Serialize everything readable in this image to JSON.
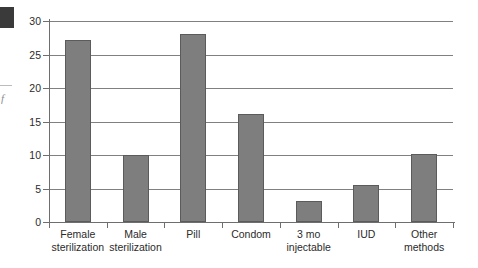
{
  "artifacts": {
    "margin_glyph": "f"
  },
  "chart_data": {
    "type": "bar",
    "title": "",
    "subtitle": "",
    "xlabel": "",
    "ylabel": "",
    "categories": [
      "Female sterilization",
      "Male sterilization",
      "Pill",
      "Condom",
      "3 mo injectable",
      "IUD",
      "Other methods"
    ],
    "category_lines": [
      [
        "Female",
        "sterilization"
      ],
      [
        "Male",
        "sterilization"
      ],
      [
        "Pill",
        ""
      ],
      [
        "Condom",
        ""
      ],
      [
        "3 mo",
        "injectable"
      ],
      [
        "IUD",
        ""
      ],
      [
        "Other",
        "methods"
      ]
    ],
    "values": [
      27.1,
      10.0,
      28.0,
      16.1,
      3.2,
      5.5,
      10.2
    ],
    "ylim": [
      0,
      30
    ],
    "ytick_labels": [
      "0",
      "5",
      "10",
      "15",
      "20",
      "25",
      "30"
    ],
    "ytick_values": [
      0,
      5,
      10,
      15,
      20,
      25,
      30
    ],
    "grid": true,
    "legend": false,
    "bar_color": "#7e7e7e",
    "bar_border_color": "#5b5b5b",
    "grid_color": "#808080",
    "axis_color": "#6e6e6e"
  }
}
